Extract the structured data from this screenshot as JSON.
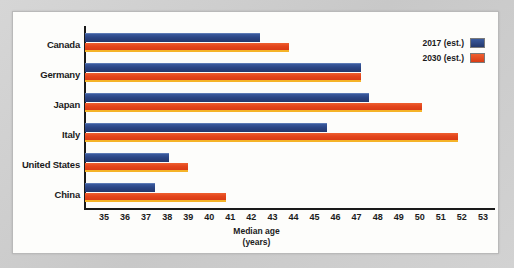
{
  "chart_data": {
    "type": "bar",
    "orientation": "horizontal",
    "title": "",
    "xlabel": "Median age (years)",
    "ylabel": "",
    "xlim": [
      35,
      53
    ],
    "grid": false,
    "legend_position": "top-right",
    "categories": [
      "Canada",
      "Germany",
      "Japan",
      "Italy",
      "United States",
      "China"
    ],
    "series": [
      {
        "name": "2017 (est.)",
        "color": "#2b4584",
        "values": [
          42.4,
          47.2,
          47.6,
          45.6,
          38.1,
          37.4
        ]
      },
      {
        "name": "2030 (est.)",
        "color": "#e4451c",
        "values": [
          43.8,
          47.2,
          50.1,
          51.8,
          39.0,
          40.8
        ]
      }
    ],
    "x_ticks": [
      35,
      36,
      37,
      38,
      39,
      40,
      41,
      42,
      43,
      44,
      45,
      46,
      47,
      48,
      49,
      50,
      51,
      52,
      53
    ]
  },
  "axis": {
    "title_line1": "Median age",
    "title_line2": "(years)"
  },
  "legend": {
    "items": [
      {
        "label": "2017 (est.)",
        "swatch": "legend-swatch-blue"
      },
      {
        "label": "2030 (est.)",
        "swatch": "legend-swatch-orange"
      }
    ]
  }
}
